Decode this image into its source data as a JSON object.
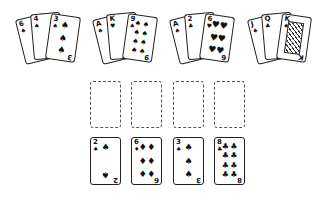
{
  "hands": [
    {
      "cards": [
        {
          "rank": "6",
          "suit": "♠",
          "pips": [
            "♠"
          ]
        },
        {
          "rank": "4",
          "suit": "♠",
          "pips": [
            "♠"
          ]
        },
        {
          "rank": "3",
          "suit": "♠",
          "pips": [
            "♠",
            "♠",
            "♠"
          ]
        }
      ]
    },
    {
      "cards": [
        {
          "rank": "A",
          "suit": "♠",
          "pips": [
            "♠"
          ]
        },
        {
          "rank": "K",
          "suit": "♥",
          "pips": [
            "♥"
          ]
        },
        {
          "rank": "9",
          "suit": "♠",
          "pips": [
            "♠",
            "♠",
            "♠",
            "♠",
            "♠",
            "♠",
            "♠",
            "♠",
            "♠"
          ]
        }
      ]
    },
    {
      "cards": [
        {
          "rank": "A",
          "suit": "♠",
          "pips": [
            "♠"
          ]
        },
        {
          "rank": "2",
          "suit": "♣",
          "pips": [
            "♣"
          ]
        },
        {
          "rank": "6",
          "suit": "♥",
          "pips": [
            "♥",
            "♥",
            "♥",
            "♥",
            "♥",
            "♥"
          ]
        }
      ]
    },
    {
      "cards": [
        {
          "rank": "J",
          "suit": "♠",
          "pips": [
            "♠"
          ]
        },
        {
          "rank": "Q",
          "suit": "♣",
          "pips": [
            "♣"
          ]
        },
        {
          "rank": "K",
          "suit": "♠",
          "pips": []
        }
      ]
    }
  ],
  "slots": [
    {
      "state": "empty"
    },
    {
      "state": "empty"
    },
    {
      "state": "empty"
    },
    {
      "state": "empty"
    }
  ],
  "row": [
    {
      "rank": "2",
      "suit": "♠",
      "pips": [
        "♠",
        "♠"
      ]
    },
    {
      "rank": "6",
      "suit": "♦",
      "pips": [
        "♦",
        "♦",
        "♦",
        "♦",
        "♦",
        "♦"
      ]
    },
    {
      "rank": "3",
      "suit": "♠",
      "pips": [
        "♠",
        "♠",
        "♠"
      ]
    },
    {
      "rank": "8",
      "suit": "♣",
      "pips": [
        "♣",
        "♣",
        "♣",
        "♣",
        "♣",
        "♣",
        "♣",
        "♣"
      ]
    }
  ]
}
